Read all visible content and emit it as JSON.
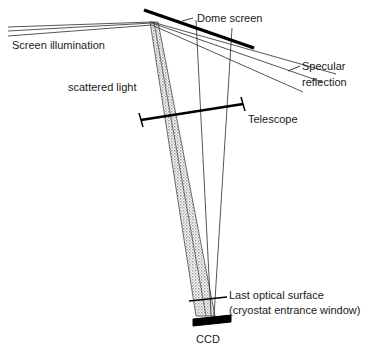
{
  "figure": {
    "width": 370,
    "height": 355,
    "background": "#ffffff",
    "ink_color": "#1a1a1a",
    "beam_fill_color": "#b9b9b9",
    "optic_color": "#000000"
  },
  "labels": {
    "dome_screen": "Dome screen",
    "screen_illumination": "Screen illumination",
    "specular_reflection_line1": "Specular",
    "specular_reflection_line2": "reflection",
    "scattered_light": "scattered light",
    "telescope": "Telescope",
    "last_optical_surface_line1": "Last optical surface",
    "last_optical_surface_line2": "(cryostat entrance window)",
    "ccd": "CCD"
  },
  "geometry": {
    "dome_screen": {
      "x1": 144,
      "y1": 10,
      "x2": 254,
      "y2": 48
    },
    "illumination_rays": [
      {
        "x1": 8,
        "y1": 27,
        "x2": 152,
        "y2": 22
      },
      {
        "x1": 8,
        "y1": 31,
        "x2": 152,
        "y2": 23
      },
      {
        "x1": 8,
        "y1": 36,
        "x2": 152,
        "y2": 25
      }
    ],
    "specular_rays": [
      {
        "x1": 152,
        "y1": 22,
        "x2": 336,
        "y2": 74
      },
      {
        "x1": 152,
        "y1": 23,
        "x2": 322,
        "y2": 82
      },
      {
        "x1": 152,
        "y1": 25,
        "x2": 303,
        "y2": 92
      }
    ],
    "scatter_cone_left": {
      "x1": 150,
      "y1": 22,
      "x2": 196,
      "y2": 316
    },
    "scatter_cone_right": {
      "x1": 158,
      "y1": 22,
      "x2": 215,
      "y2": 316
    },
    "telescope_bar": {
      "x1": 141,
      "y1": 120,
      "x2": 243,
      "y2": 104
    },
    "telescope_caps": [
      {
        "x1": 139,
        "y1": 113,
        "x2": 143,
        "y2": 127
      },
      {
        "x1": 241,
        "y1": 97,
        "x2": 245,
        "y2": 111
      }
    ],
    "telescope_edge_rays": [
      {
        "x1": 196,
        "y1": 20,
        "x2": 211,
        "y2": 316
      },
      {
        "x1": 232,
        "y1": 28,
        "x2": 214,
        "y2": 316
      }
    ],
    "cryostat_window": {
      "x1": 189,
      "y1": 301,
      "x2": 227,
      "y2": 297
    },
    "ccd_bar": {
      "x1": 193,
      "y1": 322,
      "x2": 231,
      "y2": 318
    },
    "leaders": {
      "dome_screen": {
        "x1": 182,
        "y1": 21,
        "x2": 193,
        "y2": 18
      },
      "specular": {
        "x1": 288,
        "y1": 71,
        "x2": 300,
        "y2": 66
      }
    }
  },
  "label_positions": {
    "dome_screen": {
      "x": 197,
      "y": 19
    },
    "screen_illumination": {
      "x": 12,
      "y": 46
    },
    "specular_reflection": {
      "x": 302,
      "y": 67
    },
    "scattered_light": {
      "x": 68,
      "y": 88
    },
    "telescope": {
      "x": 248,
      "y": 120
    },
    "last_optical_surface": {
      "x": 229,
      "y": 296
    },
    "ccd": {
      "x": 196,
      "y": 340
    }
  }
}
